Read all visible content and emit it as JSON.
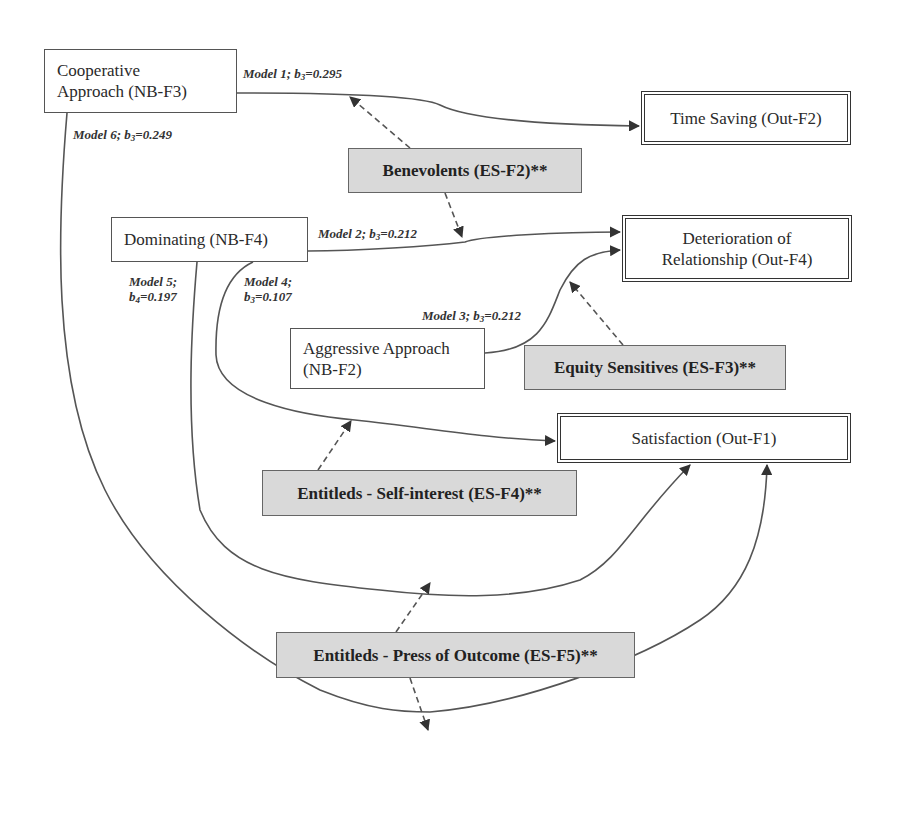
{
  "diagram": {
    "predictors": [
      {
        "id": "NB-F3",
        "label": "Cooperative Approach (NB-F3)"
      },
      {
        "id": "NB-F4",
        "label": "Dominating (NB-F4)"
      },
      {
        "id": "NB-F2",
        "label": "Aggressive Approach (NB-F2)"
      }
    ],
    "outcomes": [
      {
        "id": "Out-F2",
        "label": "Time Saving (Out-F2)"
      },
      {
        "id": "Out-F4",
        "label": "Deterioration of Relationship (Out-F4)"
      },
      {
        "id": "Out-F1",
        "label": "Satisfaction (Out-F1)"
      }
    ],
    "moderators": [
      {
        "id": "ES-F2",
        "label": "Benevolents (ES-F2)**"
      },
      {
        "id": "ES-F3",
        "label": "Equity Sensitives (ES-F3)**"
      },
      {
        "id": "ES-F4",
        "label": "Entitleds - Self-interest (ES-F4)**"
      },
      {
        "id": "ES-F5",
        "label": "Entitleds - Press of Outcome (ES-F5)**"
      }
    ],
    "models": [
      {
        "model": "Model 1",
        "coef": "b",
        "sub": "3",
        "value": "=0.295",
        "from": "NB-F3",
        "to": "Out-F2",
        "moderator": "ES-F2"
      },
      {
        "model": "Model 2",
        "coef": "b",
        "sub": "3",
        "value": "=0.212",
        "from": "NB-F4",
        "to": "Out-F4",
        "moderator": "ES-F2"
      },
      {
        "model": "Model 3",
        "coef": "b",
        "sub": "3",
        "value": "=0.212",
        "from": "NB-F2",
        "to": "Out-F4",
        "moderator": "ES-F3"
      },
      {
        "model": "Model 4",
        "coef": "b",
        "sub": "3",
        "value": "=0.107",
        "from": "NB-F4",
        "to": "Out-F1",
        "moderator": "ES-F4"
      },
      {
        "model": "Model 5",
        "coef": "b",
        "sub": "4",
        "value": "=0.197",
        "from": "NB-F4",
        "to": "Out-F1",
        "moderator": "ES-F5"
      },
      {
        "model": "Model 6",
        "coef": "b",
        "sub": "3",
        "value": "=0.249",
        "from": "NB-F3",
        "to": "Out-F1",
        "moderator": "ES-F5"
      }
    ]
  },
  "boxes": {
    "cooperative": {
      "line1": "Cooperative",
      "line2": "Approach (NB-F3)"
    },
    "dominating": {
      "text": "Dominating (NB-F4)"
    },
    "aggressive": {
      "line1": "Aggressive Approach",
      "line2": "(NB-F2)"
    },
    "time_saving": {
      "text": "Time Saving (Out-F2)"
    },
    "deterioration": {
      "line1": "Deterioration of",
      "line2": "Relationship (Out-F4)"
    },
    "satisfaction": {
      "text": "Satisfaction (Out-F1)"
    },
    "benevolents": {
      "text": "Benevolents (ES-F2)**"
    },
    "equity": {
      "text": "Equity Sensitives (ES-F3)**"
    },
    "self_interest": {
      "text": "Entitleds - Self-interest (ES-F4)**"
    },
    "press_outcome": {
      "text": "Entitleds - Press of Outcome (ES-F5)**"
    }
  },
  "labels": {
    "m1": {
      "prefix": "Model 1; b",
      "sub": "3",
      "value": "=0.295"
    },
    "m2": {
      "prefix": "Model 2; b",
      "sub": "3",
      "value": "=0.212"
    },
    "m3": {
      "prefix": "Model 3; b",
      "sub": "3",
      "value": "=0.212"
    },
    "m4": {
      "line1": "Model 4;",
      "prefix": "b",
      "sub": "3",
      "value": "=0.107"
    },
    "m5": {
      "line1": "Model 5;",
      "prefix": "b",
      "sub": "4",
      "value": "=0.197"
    },
    "m6": {
      "prefix": "Model 6; b",
      "sub": "3",
      "value": "=0.249"
    }
  },
  "colors": {
    "moderator_fill": "#d9d9d9",
    "line": "#444444",
    "outcome_border": "#333333"
  }
}
